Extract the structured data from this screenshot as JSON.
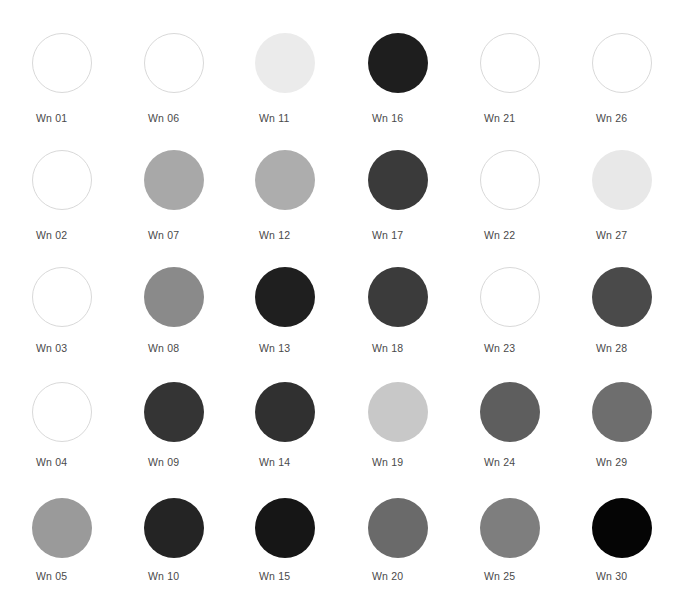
{
  "page": {
    "background_color": "#ffffff",
    "label_color": "#4a4a4a",
    "outline_color": "#d9d9d9",
    "columns": 6,
    "rows": 5,
    "swatch_shape": "circle",
    "swatch_diameter_px": 60
  },
  "layout": {
    "column_centers_x": [
      62,
      174,
      285,
      398,
      510,
      622
    ],
    "row_centers_y": [
      63,
      180,
      297,
      412,
      528
    ],
    "label_baselines_y": [
      118,
      235,
      348,
      462,
      576
    ]
  },
  "swatches": [
    {
      "label": "Wn 01",
      "color": "#ffffff",
      "outlined": true,
      "row": 1,
      "col": 1
    },
    {
      "label": "Wn 06",
      "color": "#ffffff",
      "outlined": true,
      "row": 1,
      "col": 2
    },
    {
      "label": "Wn 11",
      "color": "#ebebeb",
      "outlined": false,
      "row": 1,
      "col": 3
    },
    {
      "label": "Wn 16",
      "color": "#1e1e1e",
      "outlined": false,
      "row": 1,
      "col": 4
    },
    {
      "label": "Wn 21",
      "color": "#ffffff",
      "outlined": true,
      "row": 1,
      "col": 5
    },
    {
      "label": "Wn 26",
      "color": "#ffffff",
      "outlined": true,
      "row": 1,
      "col": 6
    },
    {
      "label": "Wn 02",
      "color": "#ffffff",
      "outlined": true,
      "row": 2,
      "col": 1
    },
    {
      "label": "Wn 07",
      "color": "#a8a8a8",
      "outlined": false,
      "row": 2,
      "col": 2
    },
    {
      "label": "Wn 12",
      "color": "#adadad",
      "outlined": false,
      "row": 2,
      "col": 3
    },
    {
      "label": "Wn 17",
      "color": "#3a3a3a",
      "outlined": false,
      "row": 2,
      "col": 4
    },
    {
      "label": "Wn 22",
      "color": "#ffffff",
      "outlined": true,
      "row": 2,
      "col": 5
    },
    {
      "label": "Wn 27",
      "color": "#e8e8e8",
      "outlined": false,
      "row": 2,
      "col": 6
    },
    {
      "label": "Wn 03",
      "color": "#ffffff",
      "outlined": true,
      "row": 3,
      "col": 1
    },
    {
      "label": "Wn 08",
      "color": "#8a8a8a",
      "outlined": false,
      "row": 3,
      "col": 2
    },
    {
      "label": "Wn 13",
      "color": "#1f1f1f",
      "outlined": false,
      "row": 3,
      "col": 3
    },
    {
      "label": "Wn 18",
      "color": "#3b3b3b",
      "outlined": false,
      "row": 3,
      "col": 4
    },
    {
      "label": "Wn 23",
      "color": "#ffffff",
      "outlined": true,
      "row": 3,
      "col": 5
    },
    {
      "label": "Wn 28",
      "color": "#4a4a4a",
      "outlined": false,
      "row": 3,
      "col": 6
    },
    {
      "label": "Wn 04",
      "color": "#ffffff",
      "outlined": true,
      "row": 4,
      "col": 1
    },
    {
      "label": "Wn 09",
      "color": "#343434",
      "outlined": false,
      "row": 4,
      "col": 2
    },
    {
      "label": "Wn 14",
      "color": "#303030",
      "outlined": false,
      "row": 4,
      "col": 3
    },
    {
      "label": "Wn 19",
      "color": "#c8c8c8",
      "outlined": false,
      "row": 4,
      "col": 4
    },
    {
      "label": "Wn 24",
      "color": "#5e5e5e",
      "outlined": false,
      "row": 4,
      "col": 5
    },
    {
      "label": "Wn 29",
      "color": "#6e6e6e",
      "outlined": false,
      "row": 4,
      "col": 6
    },
    {
      "label": "Wn 05",
      "color": "#9a9a9a",
      "outlined": false,
      "row": 5,
      "col": 1
    },
    {
      "label": "Wn 10",
      "color": "#242424",
      "outlined": false,
      "row": 5,
      "col": 2
    },
    {
      "label": "Wn 15",
      "color": "#161616",
      "outlined": false,
      "row": 5,
      "col": 3
    },
    {
      "label": "Wn 20",
      "color": "#6a6a6a",
      "outlined": false,
      "row": 5,
      "col": 4
    },
    {
      "label": "Wn 25",
      "color": "#7e7e7e",
      "outlined": false,
      "row": 5,
      "col": 5
    },
    {
      "label": "Wn 30",
      "color": "#050505",
      "outlined": false,
      "row": 5,
      "col": 6
    }
  ]
}
